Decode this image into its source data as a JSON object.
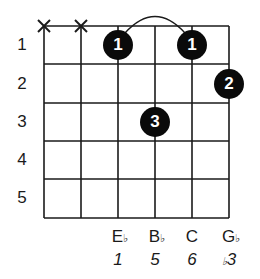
{
  "chord_diagram": {
    "strings": 6,
    "frets_shown": 5,
    "fret_numbers": [
      "1",
      "2",
      "3",
      "4",
      "5"
    ],
    "muted_strings": [
      1,
      2
    ],
    "muted_symbol": "X",
    "barre_arc": {
      "from_string": 3,
      "to_string": 5,
      "fret": 1
    },
    "fingers": [
      {
        "string": 3,
        "fret": 1,
        "finger": "1"
      },
      {
        "string": 5,
        "fret": 1,
        "finger": "1"
      },
      {
        "string": 6,
        "fret": 2,
        "finger": "2"
      },
      {
        "string": 4,
        "fret": 3,
        "finger": "3"
      }
    ],
    "note_names": [
      {
        "string": 3,
        "letter": "E",
        "accidental": "♭"
      },
      {
        "string": 4,
        "letter": "B",
        "accidental": "♭"
      },
      {
        "string": 5,
        "letter": "C",
        "accidental": ""
      },
      {
        "string": 6,
        "letter": "G",
        "accidental": "♭"
      }
    ],
    "intervals": [
      {
        "string": 3,
        "prefix": "",
        "value": "1"
      },
      {
        "string": 4,
        "prefix": "",
        "value": "5"
      },
      {
        "string": 5,
        "prefix": "",
        "value": "6"
      },
      {
        "string": 6,
        "prefix": "♭",
        "value": "3"
      }
    ],
    "colors": {
      "line": "#1a1a1a",
      "dot": "#0a0a0a",
      "dot_text": "#ffffff"
    }
  }
}
